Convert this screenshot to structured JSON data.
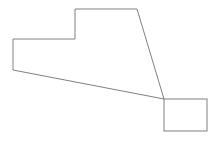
{
  "canvas": {
    "width": 222,
    "height": 142,
    "background_color": "#ffffff"
  },
  "figure": {
    "title": "Line drawing of two adjoining outlined shapes",
    "stroke_color": "#808080",
    "stroke_width": 1,
    "fill": "none",
    "shapes": [
      {
        "name": "notched-polygon",
        "type": "polygon",
        "vertex_count": 6,
        "points": "75,9 137,9 164,99 13,70 13,39 75,39",
        "vertices": [
          {
            "x": 75,
            "y": 9
          },
          {
            "x": 137,
            "y": 9
          },
          {
            "x": 164,
            "y": 99
          },
          {
            "x": 13,
            "y": 70
          },
          {
            "x": 13,
            "y": 39
          },
          {
            "x": 75,
            "y": 39
          }
        ]
      },
      {
        "name": "square",
        "type": "rect",
        "x": 164,
        "y": 99,
        "width": 43,
        "height": 32,
        "points": "164,99 207,99 207,131 164,131"
      }
    ]
  }
}
